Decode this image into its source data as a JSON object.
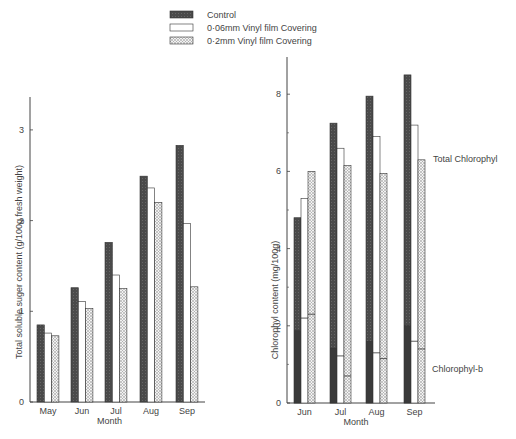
{
  "legend": {
    "items": [
      {
        "label": "Control",
        "pattern": "dark"
      },
      {
        "label": "0·06mm Vinyl film Covering",
        "pattern": "white"
      },
      {
        "label": "0·2mm Vinyl film Covering",
        "pattern": "dots"
      }
    ]
  },
  "colors": {
    "dark": "#4a4a4a",
    "white": "#ffffff",
    "dots": "#d8d8d8",
    "stroke": "#333333"
  },
  "chart_data": [
    {
      "type": "bar",
      "title": "",
      "xlabel": "Month",
      "ylabel": "Total soluble suger content (g/100g fresh weight)",
      "categories": [
        "May",
        "Jun",
        "Jul",
        "Aug",
        "Sep"
      ],
      "ylim": [
        0,
        3.4
      ],
      "yticks": [
        0,
        1,
        2,
        3
      ],
      "grid": false,
      "series": [
        {
          "name": "Control",
          "values": [
            0.85,
            1.26,
            1.76,
            2.49,
            2.83
          ]
        },
        {
          "name": "0·06mm Vinyl film Covering",
          "values": [
            0.76,
            1.11,
            1.4,
            2.36,
            1.97
          ]
        },
        {
          "name": "0·2mm Vinyl film Covering",
          "values": [
            0.73,
            1.03,
            1.25,
            2.2,
            1.27
          ]
        }
      ]
    },
    {
      "type": "bar",
      "title": "",
      "xlabel": "Month",
      "ylabel": "Chlorophyl content (mg/100g)",
      "categories": [
        "Jun",
        "Jul",
        "Aug",
        "Sep"
      ],
      "ylim": [
        0,
        9
      ],
      "yticks": [
        0,
        2,
        4,
        6,
        8
      ],
      "minor_yticks": [
        1,
        3,
        5,
        7
      ],
      "grid": false,
      "annotations": [
        "Total Chlorophyl",
        "Chlorophyl-b"
      ],
      "series": [
        {
          "name": "Control",
          "measure": "Total Chlorophyl",
          "values": [
            4.8,
            7.25,
            7.95,
            8.5
          ]
        },
        {
          "name": "0·06mm Vinyl film Covering",
          "measure": "Total Chlorophyl",
          "values": [
            5.3,
            6.6,
            6.9,
            7.2
          ]
        },
        {
          "name": "0·2mm Vinyl film Covering",
          "measure": "Total Chlorophyl",
          "values": [
            6.0,
            6.15,
            5.95,
            6.3
          ]
        },
        {
          "name": "Control",
          "measure": "Chlorophyl-b",
          "values": [
            1.87,
            1.42,
            1.6,
            2.0
          ]
        },
        {
          "name": "0·06mm Vinyl film Covering",
          "measure": "Chlorophyl-b",
          "values": [
            2.2,
            1.22,
            1.3,
            1.6
          ]
        },
        {
          "name": "0·2mm Vinyl film Covering",
          "measure": "Chlorophyl-b",
          "values": [
            2.3,
            0.7,
            1.15,
            1.4
          ]
        }
      ]
    }
  ]
}
